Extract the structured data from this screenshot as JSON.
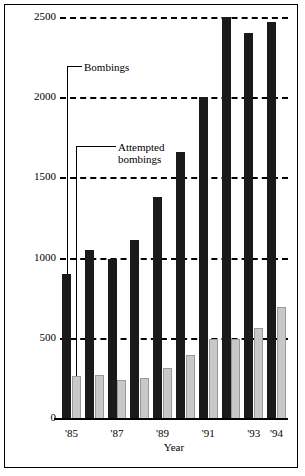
{
  "chart_data": {
    "type": "bar",
    "title": "",
    "subtitle": "",
    "xlabel": "Year",
    "ylabel": "",
    "ylim": [
      0,
      2500
    ],
    "yticks": [
      0,
      500,
      1000,
      1500,
      2000,
      2500
    ],
    "ytick_labels": [
      "0",
      "500",
      "1000",
      "1500",
      "2000",
      "2500"
    ],
    "grid": true,
    "legend_position": "inline-annotations",
    "categories": [
      "1985",
      "1986",
      "1987",
      "1988",
      "1989",
      "1990",
      "1991",
      "1992",
      "1993",
      "1994"
    ],
    "tick_labels": [
      "'85",
      "",
      "'87",
      "",
      "'89",
      "",
      "'91",
      "",
      "'93",
      "'94"
    ],
    "series": [
      {
        "name": "Bombings",
        "color": "#1a1a1a",
        "values": [
          900,
          1050,
          990,
          1110,
          1380,
          1660,
          2000,
          2500,
          2400,
          2470
        ]
      },
      {
        "name": "Attempted bombings",
        "color": "#c8c8c8",
        "values": [
          260,
          270,
          240,
          250,
          310,
          390,
          490,
          495,
          560,
          690
        ]
      }
    ],
    "annotations": [
      {
        "text": "Bombings",
        "target_series": "Bombings",
        "target_category": "1985"
      },
      {
        "text": "Attempted\nbombings",
        "target_series": "Attempted bombings",
        "target_category": "1985"
      }
    ]
  },
  "axis": {
    "x_title": "Year"
  }
}
